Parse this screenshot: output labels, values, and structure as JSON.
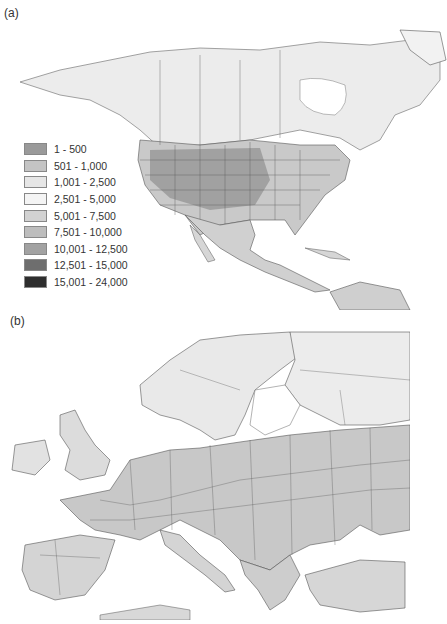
{
  "panels": {
    "a": {
      "label": "(a)",
      "region": "North America"
    },
    "b": {
      "label": "(b)",
      "region": "Europe"
    }
  },
  "legend": {
    "items": [
      {
        "label": "1 - 500",
        "color": "#9a9a9a"
      },
      {
        "label": "501 - 1,000",
        "color": "#c4c4c4"
      },
      {
        "label": "1,001 - 2,500",
        "color": "#e6e6e6"
      },
      {
        "label": "2,501 - 5,000",
        "color": "#f4f4f4"
      },
      {
        "label": "5,001 - 7,500",
        "color": "#d2d2d2"
      },
      {
        "label": "7,501 - 10,000",
        "color": "#bdbdbd"
      },
      {
        "label": "10,001 - 12,500",
        "color": "#a2a2a2"
      },
      {
        "label": "12,501 - 15,000",
        "color": "#6e6e6e"
      },
      {
        "label": "15,001 - 24,000",
        "color": "#2e2e2e"
      }
    ]
  },
  "colors": {
    "land_light": "#e8e8e8",
    "land_mid": "#bdbdbd",
    "land_dark": "#9c9c9c",
    "border": "#555555",
    "water": "#ffffff"
  }
}
